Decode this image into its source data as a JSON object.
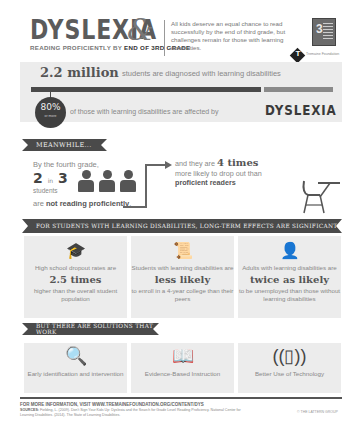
{
  "header": {
    "title": "DYSLEXIA",
    "ampersand": "&",
    "subtitle_prefix": "READING PROFICIENTLY BY ",
    "subtitle_bold": "END OF 3RD GRADE",
    "intro": "All kids deserve an equal chance to read successfully by the end of third grade, but challenges remain for those with learning disabilities.",
    "book_badge": "3",
    "logo_letter": "T",
    "logo_text": "Tremaine Foundation"
  },
  "stats": {
    "million_value": "2.2 million",
    "million_text": "students are diagnosed with learning disabilities",
    "pct_value": "80%",
    "pct_sub": "or more",
    "pct_text": "of those with learning disabilities are affected by",
    "pct_highlight": "DYSLEXIA"
  },
  "meanwhile": {
    "ribbon": "MEANWHILE...",
    "lead": "By the fourth grade,",
    "ratio_a": "2",
    "ratio_in": "in",
    "ratio_b": "3",
    "students": "students",
    "not_prefix": "are ",
    "not_bold": "not reading proficiently",
    "not_suffix": ".",
    "dropout_prefix": "and they are ",
    "dropout_big": "4 times",
    "dropout_mid": "more likely to drop out than ",
    "dropout_bold": "proficient readers"
  },
  "effects": {
    "ribbon": "FOR STUDENTS WITH LEARNING DISABILITIES, LONG-TERM EFFECTS ARE SIGNIFICANT",
    "panels": [
      {
        "icon": "graduation-cap-icon",
        "glyph": "🎓",
        "t1": "High school dropout rates are",
        "big": "2.5 times",
        "t2": "higher than the overall student population"
      },
      {
        "icon": "diploma-icon",
        "glyph": "📜",
        "t1": "Students with learning disabilities are",
        "big": "less likely",
        "t2": "to enroll in a 4-year college than their peers"
      },
      {
        "icon": "worker-globe-icon",
        "glyph": "👤",
        "t1": "Adults with learning disabilities are",
        "big": "twice as likely",
        "t2": "to be unemployed than those without learning disabilities"
      }
    ]
  },
  "solutions": {
    "ribbon": "BUT THERE ARE SOLUTIONS THAT WORK",
    "items": [
      {
        "icon": "magnifier-icon",
        "glyph": "🔍",
        "label": "Early identification and intervention"
      },
      {
        "icon": "book-icon",
        "glyph": "📖",
        "label": "Evidence-Based Instruction"
      },
      {
        "icon": "tablet-icon",
        "glyph": "((▯))",
        "label": "Better Use of Technology"
      }
    ]
  },
  "footer": {
    "more_info": "FOR MORE INFORMATION, VISIT WWW.TREMAINEFOUNDATION.ORG/CONTENT/DYS",
    "sources_label": "SOURCES:",
    "sources_text": "Fielding, L. (2009). Don't Sign Your Kids Up: Dyslexia and the Search for Grade Level Reading Proficiency. National Center for Learning Disabilities. (2014). The State of Learning Disabilities.",
    "copyright": "© THE LATTERN GROUP"
  },
  "colors": {
    "dark": "#4a4a4a",
    "panel_bg": "#ececec",
    "text_muted": "#888888"
  }
}
